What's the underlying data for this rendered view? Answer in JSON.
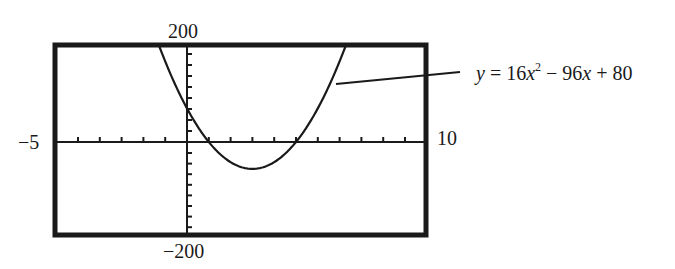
{
  "chart_data": {
    "type": "line",
    "title": "",
    "function": "y = 16x^2 - 96x + 80",
    "annotation": {
      "var": "y",
      "eq": "=",
      "a": "16",
      "x": "x",
      "exp": "2",
      "minus": "−",
      "b": "96",
      "x2": "x",
      "plus": "+",
      "c": "80"
    },
    "xlabel": "",
    "ylabel": "",
    "xlim": [
      -5,
      10
    ],
    "ylim": [
      -200,
      200
    ],
    "xlim_labels": {
      "min": "−5",
      "max": "10"
    },
    "ylim_labels": {
      "max": "200",
      "min": "−200"
    },
    "x_tick_step": 1,
    "grid": false,
    "roots": [
      1,
      5
    ],
    "vertex": [
      3,
      -64
    ],
    "y_intercept": 80,
    "x": [
      -1.4,
      -1,
      0,
      1,
      2,
      3,
      4,
      5,
      6,
      7,
      7.4
    ],
    "values": [
      237.8,
      192,
      80,
      0,
      -48,
      -64,
      -48,
      0,
      80,
      192,
      237.8
    ]
  }
}
